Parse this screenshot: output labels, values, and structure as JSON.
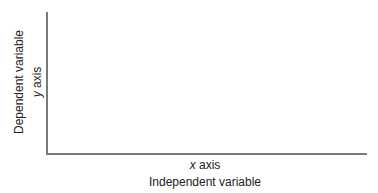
{
  "chart_data": {
    "type": "line",
    "title": "",
    "xlabel": "Independent variable",
    "xlabel_sub_var": "x",
    "xlabel_sub_text": " axis",
    "ylabel": "Dependent variable",
    "ylabel_sub_var": "y",
    "ylabel_sub_text": " axis",
    "series": [],
    "grid": false,
    "axis_color": "#7a7a7a"
  }
}
